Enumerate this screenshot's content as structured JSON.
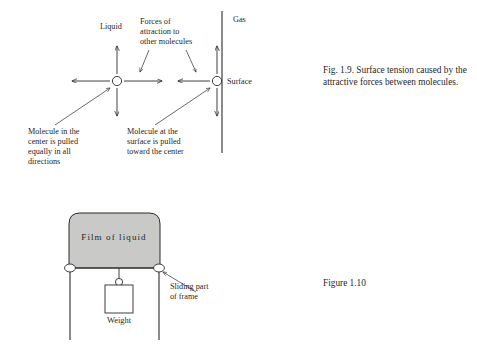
{
  "figure_19": {
    "labels": {
      "liquid": "Liquid",
      "gas": "Gas",
      "surface": "Surface",
      "forces": [
        "Forces of",
        "attraction to",
        "other molecules"
      ],
      "center_note": [
        "Molecule in the",
        "center is pulled",
        "equally in all",
        "directions"
      ],
      "surface_note": [
        "Molecule at the",
        "surface is pulled",
        "toward the center"
      ]
    },
    "caption": "Fig. 1.9. Surface tension caused by the attractive forces between molecules.",
    "center_molecule": {
      "cx": 117,
      "cy": 81,
      "r": 4.6,
      "arrows": [
        "up",
        "down",
        "left",
        "right"
      ]
    },
    "surface_molecule": {
      "cx": 217,
      "cy": 81,
      "r": 4.6,
      "arrows": [
        "up",
        "down",
        "left"
      ]
    },
    "surface_line": {
      "x": 222,
      "y_top": 11,
      "y_bottom": 153
    }
  },
  "figure_110": {
    "labels": {
      "film": "Film of liquid",
      "weight": "Weight",
      "sliding": [
        "Sliding part",
        "of frame"
      ]
    },
    "caption": "Figure 1.10",
    "film_rect": {
      "x": 69,
      "y": 213,
      "width": 91,
      "height": 55
    },
    "weight_box": {
      "x": 105,
      "y": 285,
      "width": 28,
      "height": 28
    },
    "rings": [
      {
        "cx": 70,
        "cy": 268
      },
      {
        "cx": 159,
        "cy": 268
      }
    ],
    "frame_lines": [
      {
        "x": 70,
        "y_top": 271,
        "y_bottom": 340
      },
      {
        "x": 159,
        "y_top": 271,
        "y_bottom": 340
      }
    ]
  },
  "colors": {
    "film_fill": "#c9c9c7",
    "ink": "#2b2b2b",
    "text": "#1f1f1f",
    "page": "#ffffff"
  }
}
